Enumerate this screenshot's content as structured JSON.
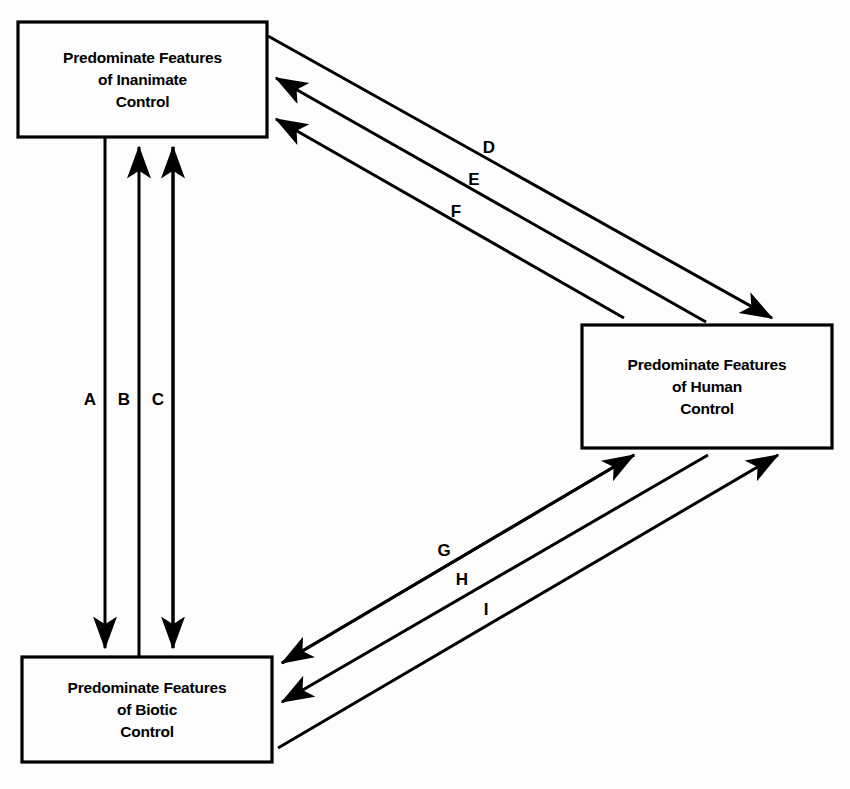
{
  "diagram": {
    "background_color": "#fdfdfd",
    "line_color": "#000000",
    "nodes": [
      {
        "id": "inanimate",
        "label_lines": [
          "Predominate Features",
          "of Inanimate",
          "Control"
        ],
        "label": "Predominate Features of Inanimate Control",
        "x": 18,
        "y": 22,
        "width": 249,
        "height": 115
      },
      {
        "id": "human",
        "label_lines": [
          "Predominate Features",
          "of Human",
          "Control"
        ],
        "label": "Predominate Features of Human Control",
        "x": 582,
        "y": 325,
        "width": 250,
        "height": 123
      },
      {
        "id": "biotic",
        "label_lines": [
          "Predominate Features",
          "of Biotic",
          "Control"
        ],
        "label": "Predominate Features of Biotic Control",
        "x": 22,
        "y": 657,
        "width": 250,
        "height": 105
      }
    ],
    "edges": [
      {
        "id": "A",
        "label": "A",
        "from": "inanimate",
        "to": "biotic",
        "direction": "down",
        "label_x": 90,
        "label_y": 400
      },
      {
        "id": "B",
        "label": "B",
        "from": "biotic",
        "to": "inanimate",
        "direction": "up",
        "label_x": 124,
        "label_y": 400
      },
      {
        "id": "C",
        "label": "C",
        "from": "biotic",
        "to": "inanimate",
        "direction": "both",
        "label_x": 158,
        "label_y": 400
      },
      {
        "id": "D",
        "label": "D",
        "from": "inanimate",
        "to": "human",
        "direction": "to",
        "label_x": 489,
        "label_y": 148
      },
      {
        "id": "E",
        "label": "E",
        "from": "human",
        "to": "inanimate",
        "direction": "from",
        "label_x": 474,
        "label_y": 180
      },
      {
        "id": "F",
        "label": "F",
        "from": "human",
        "to": "inanimate",
        "direction": "from",
        "label_x": 456,
        "label_y": 212
      },
      {
        "id": "G",
        "label": "G",
        "from": "human",
        "to": "biotic",
        "direction": "both",
        "label_x": 444,
        "label_y": 551
      },
      {
        "id": "H",
        "label": "H",
        "from": "biotic",
        "to": "human",
        "direction": "to",
        "label_x": 462,
        "label_y": 580
      },
      {
        "id": "I",
        "label": "I",
        "from": "biotic",
        "to": "human",
        "direction": "to",
        "label_x": 486,
        "label_y": 610
      }
    ]
  }
}
